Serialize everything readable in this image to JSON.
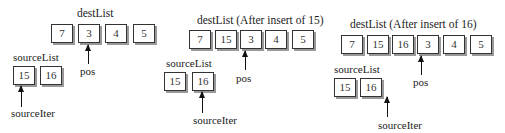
{
  "panels": [
    {
      "title": "destList",
      "dest_values": [
        "7",
        "3",
        "4",
        "5"
      ],
      "pos_label": "pos",
      "pos_index": 1,
      "source_title": "sourceList",
      "source_values": [
        "15",
        "16"
      ],
      "iter_label": "sourceIter",
      "iter_index": 0
    },
    {
      "title": "destList (After insert of 15)",
      "dest_values": [
        "7",
        "15",
        "3",
        "4",
        "5"
      ],
      "pos_label": "pos",
      "pos_index": 2,
      "source_title": "sourceList",
      "source_values": [
        "15",
        "16"
      ],
      "iter_label": "sourceIter",
      "iter_index": 1
    },
    {
      "title": "destList (After insert of 16)",
      "dest_values": [
        "7",
        "15",
        "16",
        "3",
        "4",
        "5"
      ],
      "pos_label": "pos",
      "pos_index": 3,
      "source_title": "sourceList",
      "source_values": [
        "15",
        "16"
      ],
      "iter_label": "sourceIter",
      "iter_index": "end"
    }
  ]
}
